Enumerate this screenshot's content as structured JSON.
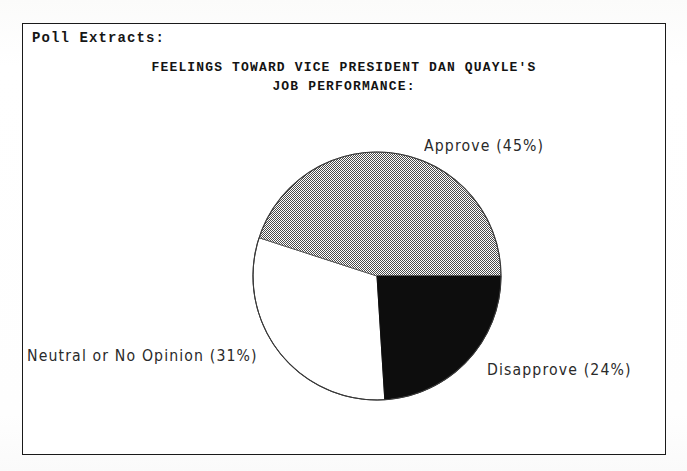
{
  "page": {
    "top_cut_text": "PRESIDENT BUSH'S",
    "box_label": "Poll Extracts:"
  },
  "chart_data": {
    "type": "pie",
    "title": "FEELINGS TOWARD VICE PRESIDENT DAN QUAYLE'S JOB PERFORMANCE:",
    "title_line1": "FEELINGS TOWARD VICE PRESIDENT DAN QUAYLE'S",
    "title_line2": "JOB PERFORMANCE:",
    "xlabel": "",
    "ylabel": "",
    "legend_position": "outside-labels",
    "grid": false,
    "categories": [
      "Approve",
      "Disapprove",
      "Neutral or No Opinion"
    ],
    "values": [
      45,
      24,
      31
    ],
    "labels": [
      "Approve  (45%)",
      "Disapprove  (24%)",
      "Neutral or No Opinion  (31%)"
    ],
    "slices": [
      {
        "name": "Approve",
        "value": 45,
        "label": "Approve  (45%)",
        "fill_style": "stipple-gray",
        "fill_color": "#a8a8a8",
        "start_angle_deg": 0,
        "end_angle_deg": 162
      },
      {
        "name": "Disapprove",
        "value": 24,
        "label": "Disapprove  (24%)",
        "fill_style": "solid-black",
        "fill_color": "#0d0d0d",
        "start_angle_deg": 273.6,
        "end_angle_deg": 360
      },
      {
        "name": "Neutral or No Opinion",
        "value": 31,
        "label": "Neutral or No Opinion  (31%)",
        "fill_style": "white",
        "fill_color": "#ffffff",
        "start_angle_deg": 162,
        "end_angle_deg": 273.6
      }
    ]
  },
  "colors": {
    "border": "#1a1a1a",
    "text": "#131313",
    "approve_fill": "#a8a8a8",
    "disapprove_fill": "#0d0d0d",
    "neutral_fill": "#ffffff",
    "outline": "#1a1a1a"
  }
}
